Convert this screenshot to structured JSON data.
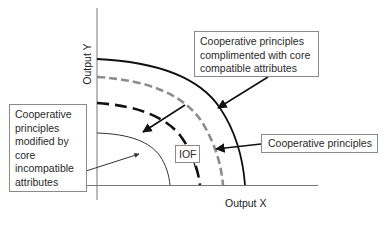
{
  "diagram": {
    "axes": {
      "y_label": "Output Y",
      "x_label": "Output X"
    },
    "curves": [
      {
        "id": "outer-solid",
        "style": "solid",
        "color": "#111111",
        "description": "Cooperative principles complimented with core compatible attributes"
      },
      {
        "id": "gray-dashed",
        "style": "dashed",
        "color": "#8c8c8c",
        "description": "Cooperative principles"
      },
      {
        "id": "black-dashed",
        "style": "dashed",
        "color": "#111111",
        "description": "IOF"
      },
      {
        "id": "inner-thin",
        "style": "solid-thin",
        "color": "#333333",
        "description": "Cooperative principles modified by core incompatible attributes"
      }
    ],
    "labels": {
      "top_right": "Cooperative principles complimented with core compatible attributes",
      "left": "Cooperative principles modified by core incompatible attributes",
      "iof": "IOF",
      "bottom_right": "Cooperative principles"
    },
    "colors": {
      "black": "#111111",
      "gray_dash": "#8c8c8c",
      "box_border": "#8a8a8a"
    }
  }
}
